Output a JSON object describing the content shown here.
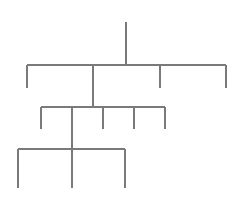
{
  "diagram": {
    "type": "tree",
    "line_color": "#7a7a7a",
    "background": "#ffffff",
    "levels": [
      {
        "name": "root",
        "stem": {
          "x": 126,
          "y1": 22,
          "y2": 65
        }
      },
      {
        "name": "level-1",
        "bar": {
          "y": 65,
          "x1": 27,
          "x2": 226
        },
        "children": [
          {
            "x": 27,
            "y1": 65,
            "y2": 88
          },
          {
            "x": 93,
            "y1": 65,
            "y2": 107
          },
          {
            "x": 160,
            "y1": 65,
            "y2": 88
          },
          {
            "x": 226,
            "y1": 65,
            "y2": 88
          }
        ]
      },
      {
        "name": "level-2",
        "bar": {
          "y": 107,
          "x1": 41,
          "x2": 165
        },
        "children": [
          {
            "x": 41,
            "y1": 107,
            "y2": 129
          },
          {
            "x": 72,
            "y1": 107,
            "y2": 149
          },
          {
            "x": 103,
            "y1": 107,
            "y2": 129
          },
          {
            "x": 134,
            "y1": 107,
            "y2": 129
          },
          {
            "x": 165,
            "y1": 107,
            "y2": 129
          }
        ]
      },
      {
        "name": "level-3",
        "bar": {
          "y": 149,
          "x1": 18,
          "x2": 125
        },
        "children": [
          {
            "x": 18,
            "y1": 149,
            "y2": 188
          },
          {
            "x": 72,
            "y1": 149,
            "y2": 188
          },
          {
            "x": 125,
            "y1": 149,
            "y2": 188
          }
        ]
      }
    ]
  }
}
